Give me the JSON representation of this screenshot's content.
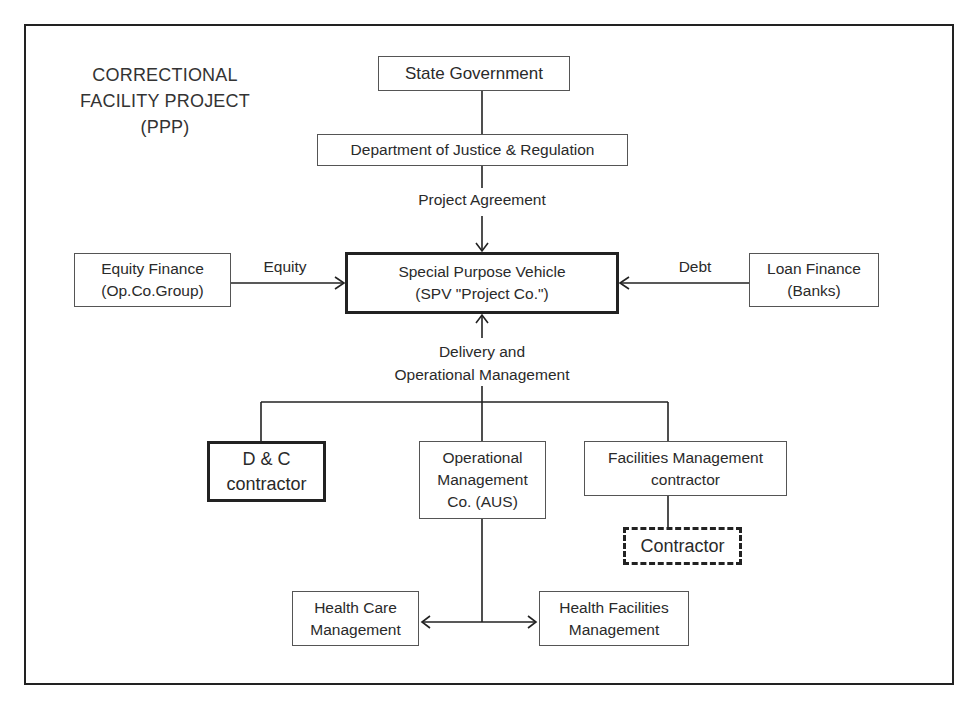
{
  "title": {
    "lines": [
      "CORRECTIONAL",
      "FACILITY PROJECT",
      "(PPP)"
    ]
  },
  "nodes": {
    "state_government": {
      "lines": [
        "State Government"
      ]
    },
    "department_of_justice": {
      "lines": [
        "Department of Justice & Regulation"
      ]
    },
    "spv": {
      "lines": [
        "Special Purpose Vehicle",
        "(SPV \"Project Co.\")"
      ]
    },
    "equity_finance": {
      "lines": [
        "Equity Finance",
        "(Op.Co.Group)"
      ]
    },
    "loan_finance": {
      "lines": [
        "Loan Finance",
        "(Banks)"
      ]
    },
    "dc_contractor": {
      "lines": [
        "D & C",
        "contractor"
      ]
    },
    "operational_management": {
      "lines": [
        "Operational",
        "Management",
        "Co. (AUS)"
      ]
    },
    "facilities_management": {
      "lines": [
        "Facilities Management",
        "contractor"
      ]
    },
    "contractor": {
      "lines": [
        "Contractor"
      ]
    },
    "health_care_management": {
      "lines": [
        "Health Care",
        "Management"
      ]
    },
    "health_facilities_management": {
      "lines": [
        "Health Facilities",
        "Management"
      ]
    }
  },
  "edges": {
    "project_agreement": "Project Agreement",
    "equity": "Equity",
    "debt": "Debt",
    "delivery": [
      "Delivery and",
      "Operational Management"
    ]
  },
  "colors": {
    "line": "#222222",
    "text": "#2a2a2a",
    "background": "#ffffff"
  }
}
